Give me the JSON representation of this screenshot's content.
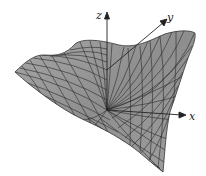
{
  "figure": {
    "type": "3d-surface-plot",
    "axes": {
      "x": {
        "label": "x"
      },
      "y": {
        "label": "y"
      },
      "z": {
        "label": "z"
      }
    },
    "colors": {
      "surface_fill": "#9a9a9a",
      "surface_shade": "#7a7a7a",
      "grid_lines": "#2a2a2a",
      "axis": "#222222",
      "background": "#ffffff"
    }
  }
}
